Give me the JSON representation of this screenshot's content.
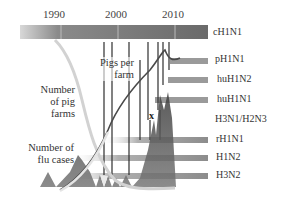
{
  "timeline": {
    "years": [
      {
        "label": "1990",
        "x": 61
      },
      {
        "label": "2000",
        "x": 118
      },
      {
        "label": "2010",
        "x": 175
      }
    ]
  },
  "strains": [
    {
      "label": "cH1N1",
      "y": 32
    },
    {
      "label": "pH1N1",
      "y": 63
    },
    {
      "label": "huH1N2",
      "y": 81
    },
    {
      "label": "huH1N1",
      "y": 101
    },
    {
      "label": "H3N1/H2N3",
      "y": 121
    },
    {
      "label": "rH1N1",
      "y": 141
    },
    {
      "label": "H1N2",
      "y": 159
    },
    {
      "label": "H3N2",
      "y": 177
    }
  ],
  "labels": {
    "pigs_per_farm": [
      "Pigs per",
      "farm"
    ],
    "number_of_pig_farms": [
      "Number",
      "of pig",
      "farms"
    ],
    "number_of_flu_cases": [
      "Number of",
      "flu cases"
    ],
    "marker": "x"
  },
  "colors": {
    "bar_dark": "#6f6f6f",
    "bar_light": "#c9c9c9",
    "strain_bar": "#9a9a9a",
    "curve": "#4a4a4a",
    "peaks": "#555555"
  }
}
